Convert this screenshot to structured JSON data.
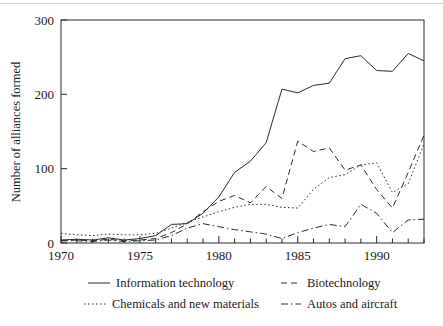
{
  "chart_data": {
    "type": "line",
    "title": "",
    "xlabel": "",
    "ylabel": "Number of alliances formed",
    "xlim": [
      1970,
      1993
    ],
    "ylim": [
      0,
      300
    ],
    "grid": false,
    "legend_position": "bottom",
    "x": [
      1970,
      1971,
      1972,
      1973,
      1974,
      1975,
      1976,
      1977,
      1978,
      1979,
      1980,
      1981,
      1982,
      1983,
      1984,
      1985,
      1986,
      1987,
      1988,
      1989,
      1990,
      1991,
      1992,
      1993
    ],
    "xticks": [
      1970,
      1975,
      1980,
      1985,
      1990
    ],
    "xtick_labels": [
      "1970",
      "1975",
      "1980",
      "1985",
      "1990"
    ],
    "yticks": [
      0,
      100,
      200,
      300
    ],
    "ytick_labels": [
      "0",
      "100",
      "200",
      "300"
    ],
    "series": [
      {
        "name": "Information technology",
        "style": "solid",
        "dash": "none",
        "values": [
          4,
          5,
          4,
          7,
          4,
          6,
          10,
          25,
          26,
          40,
          62,
          95,
          110,
          135,
          207,
          202,
          212,
          215,
          248,
          252,
          232,
          231,
          255,
          245
        ]
      },
      {
        "name": "Biotechnology",
        "style": "dashed",
        "dash": "6,4",
        "values": [
          3,
          4,
          3,
          5,
          3,
          4,
          6,
          14,
          26,
          42,
          56,
          64,
          54,
          76,
          60,
          48,
          50,
          137,
          128,
          123,
          127,
          98,
          47,
          140
        ],
        "values_corrected": [
          3,
          4,
          3,
          5,
          3,
          4,
          6,
          14,
          26,
          42,
          56,
          64,
          54,
          76,
          60,
          137,
          123,
          128,
          98,
          105,
          72,
          47,
          95,
          145
        ]
      },
      {
        "name": "Chemicals and new materials",
        "style": "dotted",
        "dash": "1.5,2.5",
        "values": [
          13,
          11,
          10,
          12,
          11,
          11,
          13,
          20,
          28,
          35,
          42,
          48,
          52,
          52,
          48,
          47,
          72,
          88,
          92,
          105,
          108,
          68,
          80,
          133
        ]
      },
      {
        "name": "Autos and aircraft",
        "style": "dashdot",
        "dash": "7,3,1.5,3",
        "values": [
          3,
          3,
          2,
          4,
          2,
          3,
          4,
          10,
          20,
          26,
          22,
          18,
          15,
          12,
          6,
          14,
          20,
          25,
          22,
          52,
          40,
          14,
          31,
          32
        ]
      }
    ]
  },
  "legend": {
    "entries": [
      {
        "label": "Information technology",
        "icon": "solid-line-swatch"
      },
      {
        "label": "Biotechnology",
        "icon": "dashed-line-swatch"
      },
      {
        "label": "Chemicals and new materials",
        "icon": "dotted-line-swatch"
      },
      {
        "label": "Autos and aircraft",
        "icon": "dashdot-line-swatch"
      }
    ]
  }
}
